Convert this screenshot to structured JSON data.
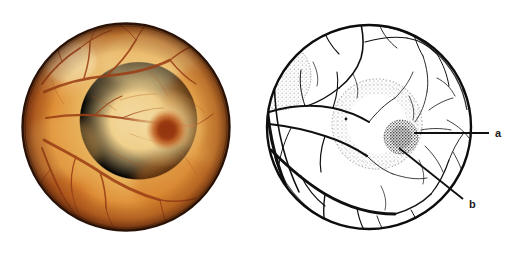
{
  "figure": {
    "title": "Retinal fundus photograph and matching schematic diagram",
    "background_color": "#ffffff",
    "width": 523,
    "height": 256
  },
  "panels": [
    {
      "id": "photo",
      "name": "fundus-photograph",
      "caption": "",
      "circle": {
        "cx": 126,
        "cy": 127,
        "r": 104
      },
      "colors": {
        "rim_dark": "#6b2a0d",
        "rim": "#b8541a",
        "mid": "#e08a2e",
        "inner": "#efb860",
        "pale": "#f2d292",
        "highlight": "#f6e0ac",
        "fovea_halo": "#e8a84a",
        "fovea": "#a8410f",
        "fovea_core": "#8e3409",
        "vessel": "#9b3d14",
        "vessel_fine": "#b4561f",
        "outline": "#1d1208"
      }
    },
    {
      "id": "diagram",
      "name": "fundus-schematic",
      "caption": "",
      "circle": {
        "cx": 369,
        "cy": 127,
        "r": 104
      },
      "colors": {
        "stroke": "#101010",
        "vessel": "#121212",
        "stipple": "#9a9a9a",
        "fovea_stipple": "#1a1a1a",
        "leader": "#101010"
      }
    }
  ],
  "labels": [
    {
      "key": "a",
      "text": "a",
      "meaning": "fovea",
      "x": 498,
      "y": 137,
      "leader": {
        "x1": 414,
        "y1": 133,
        "x2": 489,
        "y2": 133
      }
    },
    {
      "key": "b",
      "text": "b",
      "meaning": "macula",
      "x": 469,
      "y": 208,
      "leader": {
        "x1": 399,
        "y1": 148,
        "x2": 463,
        "y2": 199
      }
    }
  ]
}
